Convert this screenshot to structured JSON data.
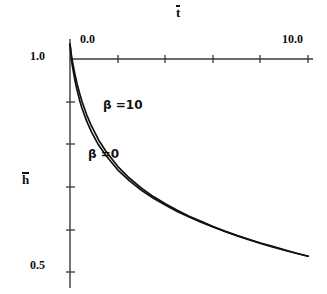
{
  "figure": {
    "background_color": "#ffffff",
    "line_color": "#111111",
    "axis_color": "#3a3a3a"
  },
  "axes": {
    "x_title": "t",
    "x_title_overbar": true,
    "y_title": "h",
    "y_title_overbar": true,
    "x_tick_labels": [
      "0.0",
      "10.0"
    ],
    "y_tick_labels": [
      "1.0",
      "0.5"
    ],
    "x_minor_tick_count": 5,
    "y_minor_tick_count": 5
  },
  "annotations": {
    "beta10": "β =10",
    "beta0": "β =0"
  },
  "chart_data": {
    "type": "line",
    "title": "",
    "subtitle": "",
    "xlabel": "t̄",
    "ylabel": "h̄",
    "xlim": [
      0.0,
      10.2
    ],
    "ylim": [
      0.5,
      1.02
    ],
    "grid": false,
    "legend_position": "inline-annotation",
    "x_ticks": [
      0.0,
      2.0,
      4.0,
      6.0,
      8.0,
      10.0
    ],
    "x_tick_labels_shown": {
      "0.0": "0.0",
      "10.0": "10.0"
    },
    "y_ticks": [
      0.5,
      0.6,
      0.7,
      0.8,
      0.9,
      1.0
    ],
    "y_tick_labels_shown": {
      "1.0": "1.0",
      "0.5": "0.5"
    },
    "series": [
      {
        "name": "β =10",
        "label_x": 1.0,
        "label_y": 0.905,
        "x": [
          0.0,
          0.05,
          0.1,
          0.2,
          0.3,
          0.4,
          0.5,
          0.7,
          0.9,
          1.2,
          1.5,
          2.0,
          2.5,
          3.0,
          3.5,
          4.0,
          4.5,
          5.0,
          5.5,
          6.0,
          6.5,
          7.0,
          7.5,
          8.0,
          8.5,
          9.0,
          9.5,
          10.0
        ],
        "y": [
          1.035,
          1.012,
          0.995,
          0.966,
          0.941,
          0.92,
          0.901,
          0.869,
          0.843,
          0.81,
          0.784,
          0.748,
          0.72,
          0.697,
          0.677,
          0.66,
          0.645,
          0.631,
          0.619,
          0.607,
          0.596,
          0.586,
          0.577,
          0.568,
          0.56,
          0.552,
          0.544,
          0.537
        ]
      },
      {
        "name": "β =0",
        "label_x": 0.68,
        "label_y": 0.793,
        "x": [
          0.0,
          0.05,
          0.1,
          0.2,
          0.3,
          0.4,
          0.5,
          0.7,
          0.9,
          1.2,
          1.5,
          2.0,
          2.5,
          3.0,
          3.5,
          4.0,
          4.5,
          5.0,
          5.5,
          6.0,
          6.5,
          7.0,
          7.5,
          8.0,
          8.5,
          9.0,
          9.5,
          10.0
        ],
        "y": [
          1.035,
          1.005,
          0.984,
          0.952,
          0.926,
          0.904,
          0.885,
          0.854,
          0.829,
          0.798,
          0.774,
          0.74,
          0.714,
          0.692,
          0.673,
          0.657,
          0.642,
          0.629,
          0.617,
          0.606,
          0.595,
          0.585,
          0.576,
          0.567,
          0.559,
          0.551,
          0.544,
          0.537
        ]
      }
    ]
  }
}
